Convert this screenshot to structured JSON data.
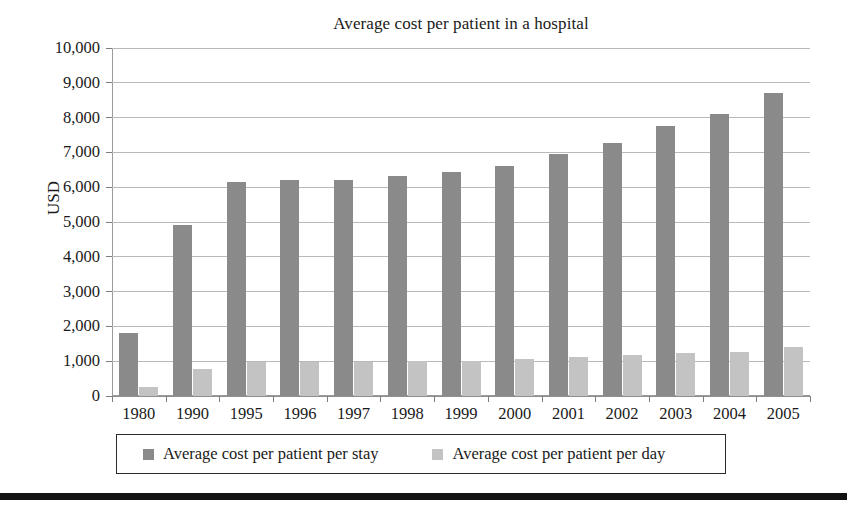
{
  "chart_data": {
    "type": "bar",
    "title": "Average cost per patient in a hospital",
    "xlabel": "",
    "ylabel": "USD",
    "categories": [
      "1980",
      "1990",
      "1995",
      "1996",
      "1997",
      "1998",
      "1999",
      "2000",
      "2001",
      "2002",
      "2003",
      "2004",
      "2005"
    ],
    "series": [
      {
        "name": "Average cost per patient per stay",
        "color": "#8a8a8a",
        "values": [
          1800,
          4900,
          6150,
          6200,
          6220,
          6330,
          6430,
          6600,
          6950,
          7270,
          7750,
          8100,
          8700
        ]
      },
      {
        "name": "Average cost per patient per day",
        "color": "#c3c3c3",
        "values": [
          250,
          780,
          980,
          980,
          990,
          1000,
          1010,
          1060,
          1110,
          1170,
          1230,
          1270,
          1400
        ]
      }
    ],
    "ylim": [
      0,
      10000
    ],
    "ytick_values": [
      0,
      1000,
      2000,
      3000,
      4000,
      5000,
      6000,
      7000,
      8000,
      9000,
      10000
    ],
    "ytick_labels": [
      "0",
      "1,000",
      "2,000",
      "3,000",
      "4,000",
      "5,000",
      "6,000",
      "7,000",
      "8,000",
      "9,000",
      "10,000"
    ],
    "grid": true,
    "legend_position": "bottom"
  },
  "colors": {
    "series_stay": "#8a8a8a",
    "series_day": "#c3c3c3",
    "gridline": "#b9b9b9",
    "axis": "#9a9a9a",
    "text": "#1a1a1a",
    "rule": "#121212"
  }
}
